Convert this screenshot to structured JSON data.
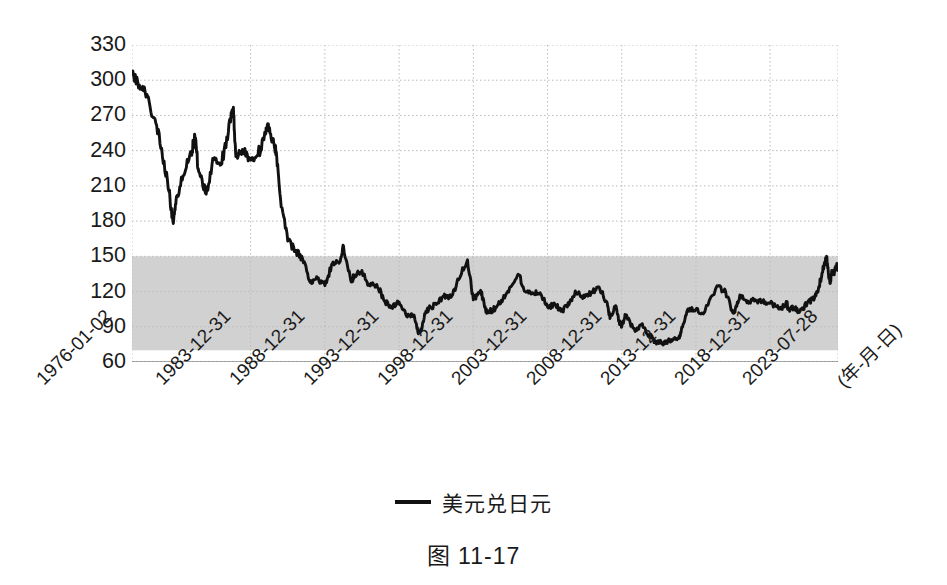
{
  "caption": "图 11-17",
  "legend": {
    "label": "美元兑日元",
    "swatch_name": "line-swatch",
    "color": "#111111"
  },
  "axis": {
    "x_unit_label": "(年-月-日)",
    "y_ticks": [
      330,
      300,
      270,
      240,
      210,
      180,
      150,
      120,
      90,
      60
    ],
    "x_ticks": [
      "1976-01-02",
      "1983-12-31",
      "1988-12-31",
      "1993-12-31",
      "1998-12-31",
      "2003-12-31",
      "2008-12-31",
      "2013-12-31",
      "2018-12-31",
      "2023-07-28"
    ]
  },
  "chart_data": {
    "type": "line",
    "title": "",
    "subtitle": "",
    "xlabel": "(年-月-日)",
    "ylabel": "",
    "ylim": [
      60,
      330
    ],
    "grid": true,
    "legend_position": "bottom-center",
    "tick_colors": {
      "axis_text": "#1a1a1a",
      "grid": "#bbbbbb"
    },
    "annotations": [
      {
        "type": "shaded-band",
        "name": "range-band-80-150",
        "y_from": 70,
        "y_to": 150,
        "color": "#c9c9c9",
        "label": ""
      }
    ],
    "xtick_labels": [
      "1976-01-02",
      "1983-12-31",
      "1988-12-31",
      "1993-12-31",
      "1998-12-31",
      "2003-12-31",
      "2008-12-31",
      "2013-12-31",
      "2018-12-31",
      "2023-07-28"
    ],
    "ytick_labels": [
      330,
      300,
      270,
      240,
      210,
      180,
      150,
      120,
      90,
      60
    ],
    "series": [
      {
        "name": "美元兑日元",
        "color": "#111111",
        "x": [
          "1976-01-02",
          "1976-07-01",
          "1977-01-01",
          "1977-07-01",
          "1978-01-01",
          "1978-07-01",
          "1978-10-15",
          "1979-01-01",
          "1979-07-01",
          "1980-01-01",
          "1980-04-01",
          "1980-07-01",
          "1981-01-01",
          "1981-07-01",
          "1982-01-01",
          "1982-07-01",
          "1982-11-01",
          "1983-01-01",
          "1983-07-01",
          "1983-12-31",
          "1984-07-01",
          "1985-01-01",
          "1985-02-25",
          "1985-07-01",
          "1985-09-22",
          "1986-01-01",
          "1986-07-01",
          "1987-01-01",
          "1987-07-01",
          "1988-01-01",
          "1988-07-01",
          "1988-12-31",
          "1989-07-01",
          "1990-01-01",
          "1990-04-01",
          "1990-10-01",
          "1991-01-01",
          "1991-07-01",
          "1992-01-01",
          "1992-07-01",
          "1993-01-01",
          "1993-07-01",
          "1993-12-31",
          "1994-07-01",
          "1995-01-01",
          "1995-04-19",
          "1995-07-01",
          "1995-10-01",
          "1996-01-01",
          "1996-07-01",
          "1997-01-01",
          "1997-07-01",
          "1998-01-01",
          "1998-08-11",
          "1998-12-31",
          "1999-07-01",
          "1999-11-01",
          "2000-01-01",
          "2000-07-01",
          "2001-01-01",
          "2001-07-01",
          "2002-01-31",
          "2002-07-01",
          "2003-01-01",
          "2003-07-01",
          "2003-12-31",
          "2004-07-01",
          "2005-01-01",
          "2005-07-01",
          "2005-12-01",
          "2006-07-01",
          "2007-01-01",
          "2007-06-22",
          "2008-01-01",
          "2008-03-17",
          "2008-08-01",
          "2008-10-24",
          "2008-12-31",
          "2009-04-01",
          "2009-11-27",
          "2010-05-01",
          "2010-11-01",
          "2011-01-01",
          "2011-03-17",
          "2011-08-01",
          "2011-10-31",
          "2012-01-01",
          "2012-07-01",
          "2012-11-01",
          "2013-01-01",
          "2013-05-22",
          "2013-12-31",
          "2014-07-01",
          "2015-06-05",
          "2016-01-01",
          "2016-06-24",
          "2016-08-01",
          "2016-12-15",
          "2017-07-01",
          "2018-01-01",
          "2018-07-01",
          "2018-12-31",
          "2019-08-26",
          "2020-02-20",
          "2020-03-09",
          "2020-08-01",
          "2021-01-01",
          "2021-07-01",
          "2022-01-01",
          "2022-04-01",
          "2022-07-01",
          "2022-10-21",
          "2022-12-20",
          "2023-01-16",
          "2023-03-01",
          "2023-05-01",
          "2023-06-30",
          "2023-07-14",
          "2023-07-28"
        ],
        "values": [
          305,
          296,
          288,
          268,
          242,
          205,
          178,
          201,
          219,
          239,
          251,
          222,
          203,
          232,
          228,
          256,
          277,
          235,
          240,
          232,
          237,
          254,
          263,
          249,
          239,
          200,
          163,
          155,
          148,
          128,
          131,
          125,
          144,
          145,
          159,
          129,
          134,
          138,
          125,
          126,
          112,
          107,
          111,
          99,
          100,
          84,
          87,
          101,
          106,
          109,
          116,
          115,
          130,
          147,
          113,
          121,
          104,
          102,
          106,
          114,
          124,
          134,
          120,
          119,
          119,
          107,
          109,
          103,
          111,
          119,
          115,
          119,
          124,
          111,
          97,
          108,
          95,
          90,
          100,
          86,
          92,
          82,
          82,
          77,
          77,
          76,
          77,
          80,
          80,
          86,
          103,
          105,
          101,
          125,
          120,
          102,
          102,
          117,
          112,
          113,
          111,
          110,
          105,
          110,
          105,
          106,
          103,
          110,
          115,
          122,
          136,
          150,
          132,
          128,
          136,
          136,
          144,
          138,
          141
        ]
      }
    ]
  }
}
